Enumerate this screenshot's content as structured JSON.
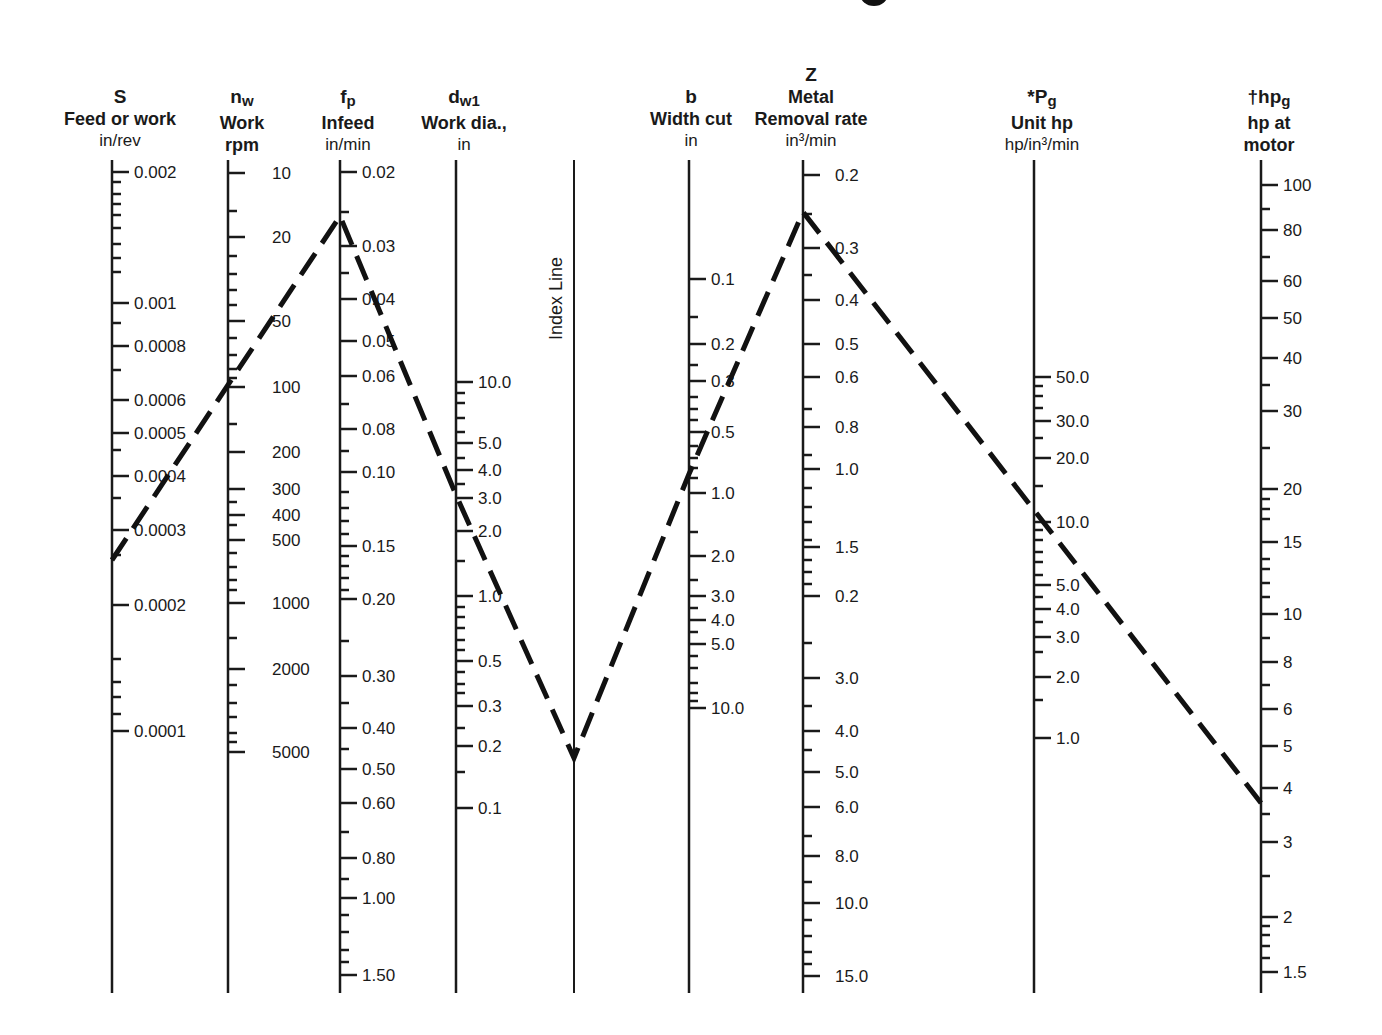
{
  "chart_data": {
    "type": "nomogram",
    "title": "",
    "scales": [
      {
        "id": "S",
        "symbol": "S",
        "sub": "",
        "name": "Feed or work",
        "unit": "in/rev",
        "x": 112,
        "top": 160,
        "bottom": 993,
        "ticks_side": "right",
        "labels": [
          {
            "v": "0.002",
            "y": 172
          },
          {
            "v": "0.001",
            "y": 303
          },
          {
            "v": "0.0008",
            "y": 346
          },
          {
            "v": "0.0006",
            "y": 400
          },
          {
            "v": "0.0005",
            "y": 433
          },
          {
            "v": "0.0004",
            "y": 476
          },
          {
            "v": "0.0003",
            "y": 530
          },
          {
            "v": "0.0002",
            "y": 605
          },
          {
            "v": "0.0001",
            "y": 731
          }
        ],
        "minor": [
          182,
          194,
          204,
          215,
          228,
          244,
          258,
          272,
          323,
          370,
          450,
          498,
          555,
          659,
          682,
          697,
          714
        ]
      },
      {
        "id": "nw",
        "symbol": "n",
        "sub": "w",
        "name": "Work",
        "name2": "rpm",
        "unit": "",
        "x": 228,
        "top": 160,
        "bottom": 993,
        "ticks_side": "right",
        "label_offset": 44,
        "labels": [
          {
            "v": "10",
            "y": 173
          },
          {
            "v": "20",
            "y": 237
          },
          {
            "v": "50",
            "y": 321
          },
          {
            "v": "100",
            "y": 387
          },
          {
            "v": "200",
            "y": 452
          },
          {
            "v": "300",
            "y": 489
          },
          {
            "v": "400",
            "y": 515
          },
          {
            "v": "500",
            "y": 540
          },
          {
            "v": "1000",
            "y": 603
          },
          {
            "v": "2000",
            "y": 669
          },
          {
            "v": "5000",
            "y": 752
          }
        ],
        "minor": [
          211,
          256,
          274,
          290,
          305,
          338,
          355,
          369,
          378,
          424,
          502,
          525,
          553,
          567,
          580,
          590,
          638,
          685,
          703,
          717,
          733,
          742
        ]
      },
      {
        "id": "fp",
        "symbol": "f",
        "sub": "p",
        "name": "Infeed",
        "unit": "in/min",
        "x": 340,
        "top": 160,
        "bottom": 993,
        "ticks_side": "right",
        "labels": [
          {
            "v": "0.02",
            "y": 172
          },
          {
            "v": "0.03",
            "y": 246
          },
          {
            "v": "0.04",
            "y": 299
          },
          {
            "v": "0.05",
            "y": 341
          },
          {
            "v": "0.06",
            "y": 376
          },
          {
            "v": "0.08",
            "y": 429
          },
          {
            "v": "0.10",
            "y": 472
          },
          {
            "v": "0.15",
            "y": 546
          },
          {
            "v": "0.20",
            "y": 599
          },
          {
            "v": "0.30",
            "y": 676
          },
          {
            "v": "0.40",
            "y": 728
          },
          {
            "v": "0.50",
            "y": 769
          },
          {
            "v": "0.60",
            "y": 803
          },
          {
            "v": "0.80",
            "y": 858
          },
          {
            "v": "1.00",
            "y": 898
          },
          {
            "v": "1.50",
            "y": 975
          }
        ],
        "minor": [
          212,
          273,
          404,
          451,
          492,
          508,
          521,
          534,
          556,
          566,
          578,
          590,
          641,
          703,
          749,
          832,
          879,
          915,
          932,
          950,
          962
        ]
      },
      {
        "id": "dw1",
        "symbol": "d",
        "sub": "w1",
        "name": "Work dia.,",
        "unit": "in",
        "x": 456,
        "top": 160,
        "bottom": 993,
        "ticks_side": "right",
        "labels": [
          {
            "v": "10.0",
            "y": 382
          },
          {
            "v": "5.0",
            "y": 443
          },
          {
            "v": "4.0",
            "y": 470
          },
          {
            "v": "3.0",
            "y": 498
          },
          {
            "v": "2.0",
            "y": 531
          },
          {
            "v": "1.0",
            "y": 596
          },
          {
            "v": "0.5",
            "y": 661
          },
          {
            "v": "0.3",
            "y": 706
          },
          {
            "v": "0.2",
            "y": 746
          },
          {
            "v": "0.1",
            "y": 808
          }
        ],
        "minor": [
          393,
          403,
          418,
          432,
          458,
          484,
          561,
          607,
          617,
          628,
          640,
          650,
          672,
          684,
          693,
          728,
          772
        ]
      },
      {
        "id": "index",
        "symbol": "",
        "name": "Index Line",
        "unit": "",
        "x": 574,
        "top": 160,
        "bottom": 993,
        "labels": [],
        "minor": []
      },
      {
        "id": "b",
        "symbol": "b",
        "sub": "",
        "name": "Width cut",
        "unit": "in",
        "x": 689,
        "top": 160,
        "bottom": 993,
        "ticks_side": "right",
        "labels": [
          {
            "v": "0.1",
            "y": 279
          },
          {
            "v": "0.2",
            "y": 344
          },
          {
            "v": "0.3",
            "y": 381
          },
          {
            "v": "0.5",
            "y": 432
          },
          {
            "v": "1.0",
            "y": 493
          },
          {
            "v": "2.0",
            "y": 556
          },
          {
            "v": "3.0",
            "y": 596
          },
          {
            "v": "4.0",
            "y": 620
          },
          {
            "v": "5.0",
            "y": 644
          },
          {
            "v": "10.0",
            "y": 708
          }
        ],
        "minor": [
          317,
          365,
          397,
          409,
          420,
          446,
          458,
          468,
          478,
          532,
          580,
          608,
          632,
          656,
          668,
          683,
          693,
          701
        ]
      },
      {
        "id": "Z",
        "symbol": "Z",
        "sub": "",
        "name": "Metal",
        "name2": "Removal rate",
        "unit": "in³/min",
        "x": 803,
        "top": 160,
        "bottom": 993,
        "ticks_side": "right",
        "label_offset": 32,
        "labels": [
          {
            "v": "0.2",
            "y": 175
          },
          {
            "v": "0.3",
            "y": 248
          },
          {
            "v": "0.4",
            "y": 300
          },
          {
            "v": "0.5",
            "y": 344
          },
          {
            "v": "0.6",
            "y": 377
          },
          {
            "v": "0.8",
            "y": 427
          },
          {
            "v": "1.0",
            "y": 469
          },
          {
            "v": "1.5",
            "y": 547
          },
          {
            "v": "0.2",
            "y": 596
          },
          {
            "v": "3.0",
            "y": 678
          },
          {
            "v": "4.0",
            "y": 731
          },
          {
            "v": "5.0",
            "y": 772
          },
          {
            "v": "6.0",
            "y": 807
          },
          {
            "v": "8.0",
            "y": 856
          },
          {
            "v": "10.0",
            "y": 903
          },
          {
            "v": "15.0",
            "y": 976
          }
        ],
        "minor": [
          214,
          275,
          409,
          455,
          488,
          507,
          522,
          540,
          560,
          572,
          584,
          643,
          706,
          750,
          836,
          882,
          920,
          936,
          952,
          964
        ]
      },
      {
        "id": "Pg",
        "symbol": "*P",
        "sub": "g",
        "name": "Unit hp",
        "unit": "hp/in³/min",
        "x": 1034,
        "top": 160,
        "bottom": 993,
        "ticks_side": "right",
        "labels": [
          {
            "v": "50.0",
            "y": 377
          },
          {
            "v": "30.0",
            "y": 421
          },
          {
            "v": "20.0",
            "y": 458
          },
          {
            "v": "10.0",
            "y": 522
          },
          {
            "v": "5.0",
            "y": 585
          },
          {
            "v": "4.0",
            "y": 609
          },
          {
            "v": "3.0",
            "y": 637
          },
          {
            "v": "2.0",
            "y": 677
          },
          {
            "v": "1.0",
            "y": 738
          }
        ],
        "minor": [
          386,
          396,
          408,
          438,
          486,
          530,
          540,
          552,
          562,
          575,
          597,
          622,
          652,
          700
        ]
      },
      {
        "id": "hpg",
        "symbol": "†hp",
        "sub": "g",
        "name": "hp at",
        "name2": "motor",
        "unit": "",
        "x": 1261,
        "top": 160,
        "bottom": 993,
        "ticks_side": "right",
        "labels": [
          {
            "v": "100",
            "y": 185
          },
          {
            "v": "80",
            "y": 230
          },
          {
            "v": "60",
            "y": 281
          },
          {
            "v": "50",
            "y": 318
          },
          {
            "v": "40",
            "y": 358
          },
          {
            "v": "30",
            "y": 411
          },
          {
            "v": "20",
            "y": 489
          },
          {
            "v": "15",
            "y": 542
          },
          {
            "v": "10",
            "y": 614
          },
          {
            "v": "8",
            "y": 662
          },
          {
            "v": "6",
            "y": 709
          },
          {
            "v": "5",
            "y": 746
          },
          {
            "v": "4",
            "y": 788
          },
          {
            "v": "3",
            "y": 842
          },
          {
            "v": "2",
            "y": 917
          },
          {
            "v": "1.5",
            "y": 972
          }
        ],
        "minor": [
          209,
          257,
          385,
          448,
          499,
          509,
          519,
          559,
          569,
          583,
          597,
          638,
          685,
          814,
          876,
          926,
          935,
          946,
          958
        ]
      }
    ],
    "index_label": "Index Line",
    "example_path": {
      "style": "dashed",
      "points": [
        {
          "scale": "S",
          "x": 112,
          "y": 560,
          "value": "~0.00027"
        },
        {
          "scale": "fp",
          "x": 340,
          "y": 216,
          "value": "~0.025"
        },
        {
          "scale": "dw1",
          "x": 456,
          "y": 495,
          "value": "~3.0"
        },
        {
          "scale": "index",
          "x": 574,
          "y": 758
        },
        {
          "scale": "b",
          "x": 689,
          "y": 474,
          "value": "~0.8"
        },
        {
          "scale": "Z",
          "x": 803,
          "y": 212,
          "value": "~0.25"
        },
        {
          "scale": "Pg",
          "x": 1034,
          "y": 510,
          "value": "~12"
        },
        {
          "scale": "hpg",
          "x": 1261,
          "y": 803,
          "value": "~3.7"
        }
      ]
    }
  }
}
